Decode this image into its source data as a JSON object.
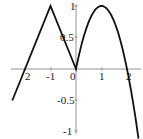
{
  "chart_data": {
    "type": "line",
    "title": "",
    "xlabel": "",
    "ylabel": "",
    "xlim": [
      -2.5,
      2.5
    ],
    "ylim": [
      -1,
      1
    ],
    "grid": false,
    "x_ticks": [
      "2",
      "-1",
      "0",
      "1",
      "2"
    ],
    "x_tick_values": [
      -2,
      -1,
      0,
      1,
      2
    ],
    "y_ticks": [
      "1",
      "0.5",
      "-0.5",
      "-1"
    ],
    "y_tick_values": [
      1,
      0.5,
      -0.5,
      -1
    ],
    "series": [
      {
        "name": "f(x)",
        "description": "piecewise: x+2 on [-2.5,-1], -x on [-1,0], 2x-x^2 on [0,2.45]",
        "x": [
          -2.5,
          -2,
          -1,
          -0.5,
          0,
          0.25,
          0.5,
          1,
          1.5,
          2,
          2.45
        ],
        "values": [
          -0.5,
          0,
          1,
          0.5,
          0,
          0.44,
          0.75,
          1,
          0.75,
          0,
          -1.1
        ]
      }
    ]
  },
  "axes": {
    "x_labels": [
      {
        "text": "2",
        "x": 84,
        "y": 80
      },
      {
        "text": "-1",
        "x": 51,
        "y": 80
      },
      {
        "text": "0",
        "x": 73,
        "y": 80
      },
      {
        "text": "1",
        "x": 101,
        "y": 80
      },
      {
        "text": "2",
        "x": 128,
        "y": 80
      }
    ],
    "y_labels": [
      {
        "text": "1",
        "x": 70,
        "y": 10
      },
      {
        "text": "0.5",
        "x": 60,
        "y": 41
      },
      {
        "text": "-0.5",
        "x": 57,
        "y": 104
      },
      {
        "text": "-1",
        "x": 63,
        "y": 135
      }
    ]
  }
}
